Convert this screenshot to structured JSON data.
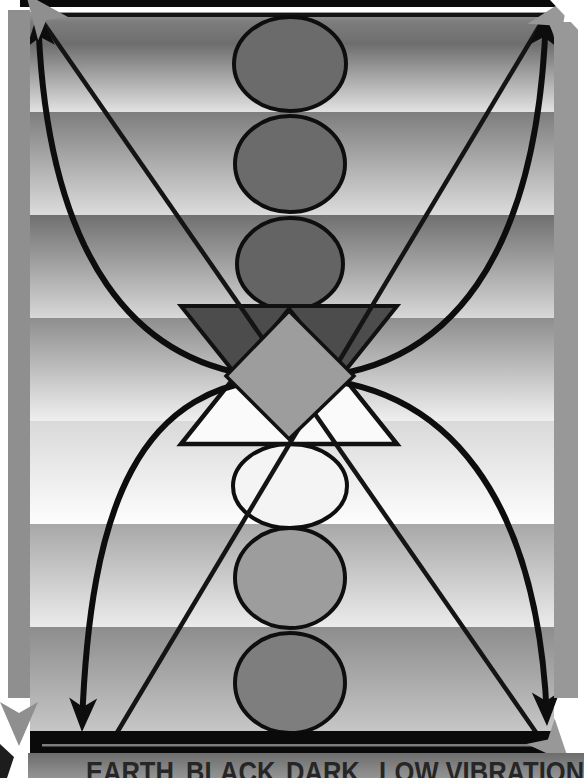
{
  "caption": {
    "labels": [
      "EARTH",
      "BLACK",
      "DARK",
      "LOW VIBRATION"
    ]
  },
  "palette": {
    "upper_circle_1": "#6b6b6b",
    "upper_circle_2": "#6b6b6b",
    "upper_circle_3": "#646464",
    "lower_circle_white": "#f4f4f4",
    "lower_circle_mid": "#9d9d9d",
    "lower_circle_bottom": "#7e7e7e",
    "dark_triangle": "#4c4c4c",
    "light_triangle": "#fafafa",
    "diamond": "#9d9d9d",
    "side_bar_left": "#8f8f8f",
    "side_bar_right": "#989898",
    "gray_arrow": "#8f8f8f",
    "line_color": "#141414",
    "arc_color": "#0d0d0d",
    "top_bar": "#0a0a0a",
    "bottom_bar": "#0a0a0a",
    "caption_text": "#262626"
  }
}
